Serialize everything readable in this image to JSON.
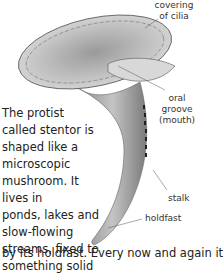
{
  "illustration": {
    "subject": "stentor",
    "labels": {
      "cilia": "covering of cilia",
      "cilia_line1": "covering",
      "cilia_line2": "of cilia",
      "oral_line1": "oral",
      "oral_line2": "groove",
      "oral_line3": "(mouth)",
      "stalk": "stalk",
      "holdfast": "holdfast"
    }
  },
  "body_text": {
    "lines": [
      "The protist",
      "called stentor is",
      "shaped like a",
      "microscopic",
      "mushroom. It lives in",
      "ponds, lakes and",
      "slow-flowing",
      "streams, fixed to",
      "something solid"
    ],
    "overflow": "by its holdfast. Every now and again it"
  }
}
